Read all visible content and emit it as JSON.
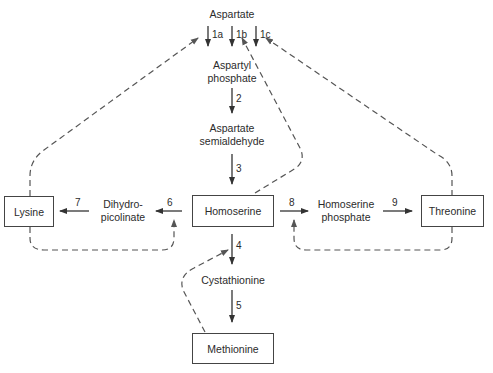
{
  "diagram": {
    "nodes": {
      "aspartate": "Aspartate",
      "aspartyl_phosphate_1": "Aspartyl",
      "aspartyl_phosphate_2": "phosphate",
      "aspartate_semialdehyde_1": "Aspartate",
      "aspartate_semialdehyde_2": "semialdehyde",
      "homoserine": "Homoserine",
      "dihydropicolinate_1": "Dihydro-",
      "dihydropicolinate_2": "picolinate",
      "lysine": "Lysine",
      "homoserine_phosphate_1": "Homoserine",
      "homoserine_phosphate_2": "phosphate",
      "threonine": "Threonine",
      "cystathionine": "Cystathionine",
      "methionine": "Methionine"
    },
    "steps": {
      "s1a": "1a",
      "s1b": "1b",
      "s1c": "1c",
      "s2": "2",
      "s3": "3",
      "s4": "4",
      "s5": "5",
      "s6": "6",
      "s7": "7",
      "s8": "8",
      "s9": "9"
    },
    "colors": {
      "line": "#333333",
      "dashed": "#555555"
    }
  }
}
